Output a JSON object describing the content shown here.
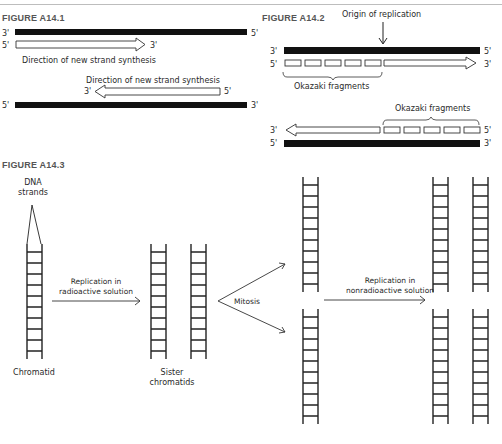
{
  "figures": {
    "a14_1": {
      "label": "FIGURE A14.1",
      "top_strand": {
        "left_end": "3'",
        "right_end": "5'"
      },
      "new_strand_top": {
        "left_end": "5'",
        "right_end": "3'"
      },
      "direction_label_top": "Direction of new strand synthesis",
      "direction_label_bottom": "Direction of new strand synthesis",
      "new_strand_bottom": {
        "left_end": "3'",
        "right_end": "5'"
      },
      "bottom_strand": {
        "left_end": "5'",
        "right_end": "3'"
      }
    },
    "a14_2": {
      "label": "FIGURE A14.2",
      "origin_label": "Origin of replication",
      "top_strand": {
        "left_end": "3'",
        "right_end": "5'"
      },
      "new_strand_top": {
        "left_end": "5'",
        "right_end": "3'"
      },
      "okazaki_label_top": "Okazaki fragments",
      "okazaki_label_bottom": "Okazaki fragments",
      "new_strand_bottom": {
        "left_end": "3'",
        "right_end": "5'"
      },
      "bottom_strand": {
        "left_end": "5'",
        "right_end": "3'"
      },
      "fragment_count": 5
    },
    "a14_3": {
      "label": "FIGURE A14.3",
      "dna_strands_label_1": "DNA",
      "dna_strands_label_2": "strands",
      "chromatid_label": "Chromatid",
      "step1_label_1": "Replication in",
      "step1_label_2": "radioactive solution",
      "sister_label_1": "Sister",
      "sister_label_2": "chromatids",
      "mitosis_label": "Mitosis",
      "step2_label_1": "Replication in",
      "step2_label_2": "nonradioactive solution"
    }
  },
  "colors": {
    "strand": "#111111",
    "outline": "#333333",
    "label_gray": "#555555",
    "rule": "#bdbdbd"
  }
}
